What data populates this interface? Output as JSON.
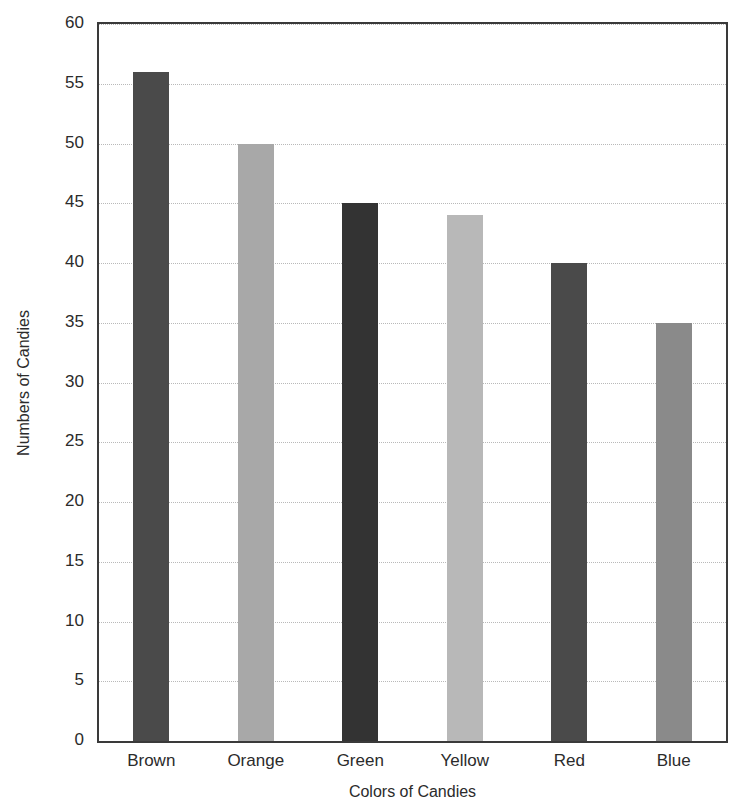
{
  "chart_data": {
    "type": "bar",
    "title": "",
    "xlabel": "Colors of Candies",
    "ylabel": "Numbers of Candies",
    "categories": [
      "Brown",
      "Orange",
      "Green",
      "Yellow",
      "Red",
      "Blue"
    ],
    "values": [
      56,
      50,
      45,
      44,
      40,
      35
    ],
    "series": [
      {
        "name": "Numbers of Candies",
        "values": [
          56,
          50,
          45,
          44,
          40,
          35
        ]
      }
    ],
    "bar_colors": [
      "#4a4a4a",
      "#a8a8a8",
      "#333333",
      "#b8b8b8",
      "#4a4a4a",
      "#8a8a8a"
    ],
    "ylim": [
      0,
      60
    ],
    "ytick_step": 5,
    "yticks": [
      0,
      5,
      10,
      15,
      20,
      25,
      30,
      35,
      40,
      45,
      50,
      55,
      60
    ],
    "ytick_labels": [
      "0",
      "5",
      "10",
      "15",
      "20",
      "25",
      "30",
      "35",
      "40",
      "45",
      "50",
      "55",
      "60"
    ],
    "grid": "horizontal-dotted",
    "legend": "none",
    "frame_color": "#3a3a3a",
    "gridline_color": "#b9b9b9",
    "background": "#ffffff"
  },
  "axes": {
    "y_title": "Numbers of Candies",
    "x_title": "Colors of Candies"
  }
}
